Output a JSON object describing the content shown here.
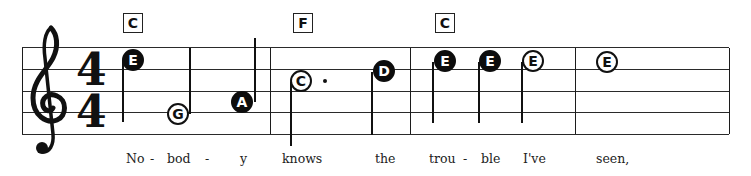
{
  "score": {
    "clef": "treble-clef",
    "time_signature": {
      "top": "4",
      "bottom": "4"
    },
    "chords": [
      {
        "label": "C",
        "x": 123
      },
      {
        "label": "F",
        "x": 293
      },
      {
        "label": "C",
        "x": 435
      }
    ],
    "notes": [
      {
        "label": "E",
        "style": "filled",
        "x": 133,
        "y": 60,
        "stem": "down-left",
        "duration": "quarter"
      },
      {
        "label": "G",
        "style": "open",
        "x": 178,
        "y": 114,
        "stem": "up-right",
        "duration": "half"
      },
      {
        "label": "A",
        "style": "filled",
        "x": 242,
        "y": 102,
        "stem": "up-right",
        "duration": "quarter"
      },
      {
        "label": "C",
        "style": "open",
        "x": 301,
        "y": 81,
        "stem": "down-left",
        "duration": "dotted-half",
        "dotted": true
      },
      {
        "label": "D",
        "style": "filled",
        "x": 384,
        "y": 71,
        "stem": "down-left",
        "duration": "quarter"
      },
      {
        "label": "E",
        "style": "filled",
        "x": 445,
        "y": 61,
        "stem": "down-left",
        "duration": "quarter"
      },
      {
        "label": "E",
        "style": "filled",
        "x": 490,
        "y": 61,
        "stem": "down-left",
        "duration": "quarter"
      },
      {
        "label": "E",
        "style": "open",
        "x": 533,
        "y": 61,
        "stem": "down-left",
        "duration": "half"
      },
      {
        "label": "E",
        "style": "open",
        "x": 607,
        "y": 62,
        "stem": "none",
        "duration": "whole"
      }
    ],
    "lyrics": [
      {
        "text": "No",
        "x": 126
      },
      {
        "text": "-",
        "x": 150
      },
      {
        "text": "bod",
        "x": 167
      },
      {
        "text": "-",
        "x": 205
      },
      {
        "text": "y",
        "x": 240
      },
      {
        "text": "knows",
        "x": 282
      },
      {
        "text": "the",
        "x": 375
      },
      {
        "text": "trou",
        "x": 429
      },
      {
        "text": "-",
        "x": 463
      },
      {
        "text": "ble",
        "x": 481
      },
      {
        "text": "I've",
        "x": 523
      },
      {
        "text": "seen,",
        "x": 596
      }
    ]
  }
}
